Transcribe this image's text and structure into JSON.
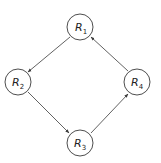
{
  "diagram": {
    "type": "directed-cycle-graph",
    "colors": {
      "stroke": "#3a3a3a",
      "text": "#222222",
      "background": "#ffffff"
    },
    "nodes": [
      {
        "id": "R1",
        "letter": "R",
        "sub": "1",
        "cx": 80,
        "cy": 27
      },
      {
        "id": "R2",
        "letter": "R",
        "sub": "2",
        "cx": 18,
        "cy": 82
      },
      {
        "id": "R3",
        "letter": "R",
        "sub": "3",
        "cx": 80,
        "cy": 143
      },
      {
        "id": "R4",
        "letter": "R",
        "sub": "4",
        "cx": 137,
        "cy": 82
      }
    ],
    "edges": [
      {
        "from": "R1",
        "to": "R2"
      },
      {
        "from": "R2",
        "to": "R3"
      },
      {
        "from": "R3",
        "to": "R4"
      },
      {
        "from": "R4",
        "to": "R1"
      }
    ]
  }
}
